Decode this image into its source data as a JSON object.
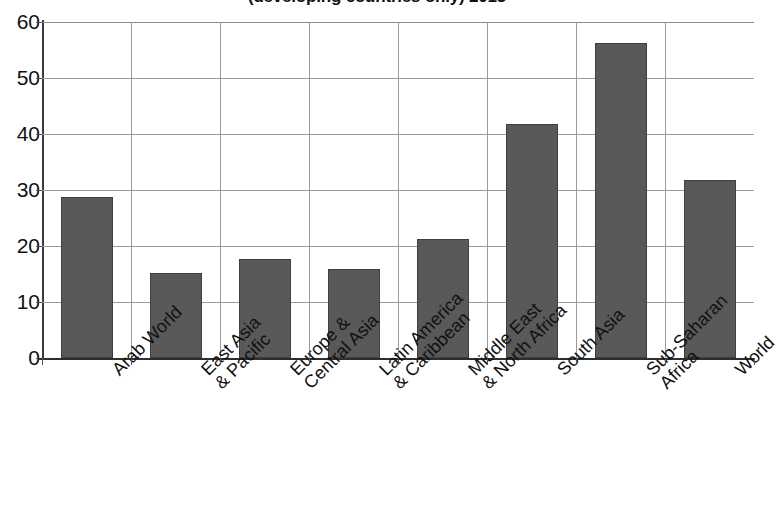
{
  "chart_data": {
    "type": "bar",
    "title": "(developing countries only) 2013",
    "xlabel": "",
    "ylabel": "",
    "ylim": [
      0,
      60
    ],
    "yticks": [
      0,
      10,
      20,
      30,
      40,
      50,
      60
    ],
    "grid": true,
    "legend": false,
    "bar_color": "#595959",
    "bar_edge_color": "#3f3f3f",
    "gridline_color": "#9a9a9a",
    "axis_color": "#2e2e2e",
    "categories": [
      "Arab World",
      "East Asia\n& Pacific",
      "Europe &\nCentral Asia",
      "Latin America\n& Caribbean",
      "Middle East\n& North Africa",
      "South Asia",
      "Sub-Saharan\nAfrica",
      "World"
    ],
    "values": [
      28.7,
      15.2,
      17.7,
      15.9,
      21.2,
      41.8,
      56.3,
      31.7
    ]
  },
  "y_tick_labels": [
    "60",
    "50",
    "40",
    "30",
    "20",
    "10",
    "0"
  ]
}
